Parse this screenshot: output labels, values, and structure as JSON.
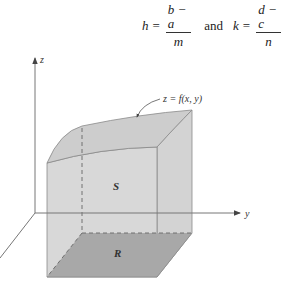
{
  "formula": {
    "h_var": "h",
    "h_eq": "=",
    "h_num": "b − a",
    "h_den": "m",
    "conj": "and",
    "k_var": "k",
    "k_eq": "=",
    "k_num": "d − c",
    "k_den": "n"
  },
  "figure": {
    "axes": {
      "z_label": "z",
      "y_label": "y"
    },
    "surface_label": "z = f(x, y)",
    "solid_label": "S",
    "region_label": "R",
    "colors": {
      "solid_fill": "#d6d6d6",
      "top_fill": "#cfcfcf",
      "region_fill": "#a9a9a9",
      "edge": "#8a8a8a",
      "axis": "#777777"
    }
  }
}
